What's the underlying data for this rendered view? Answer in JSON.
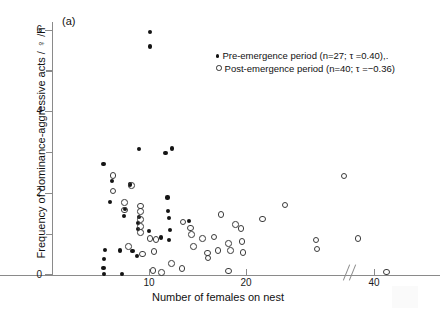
{
  "figure": {
    "panel_label": "(a)",
    "background_color": "#ffffff",
    "axis_color": "#8a8a8a",
    "point_color": "#141414"
  },
  "chart_data": {
    "type": "scatter",
    "title": "",
    "panel": "(a)",
    "xlabel": "Number of females on nest",
    "ylabel": "Frequency of dominance-aggressive acts / ♀ /h",
    "xlim": [
      0,
      48
    ],
    "ylim": [
      0,
      6.2
    ],
    "grid": false,
    "legend_position": "top-right",
    "axis_break": {
      "present": true,
      "symbol": "//",
      "between": [
        30,
        38
      ]
    },
    "xticks": [
      {
        "value": 10,
        "label": "10"
      },
      {
        "value": 20,
        "label": "20"
      },
      {
        "value": 40,
        "label": "40"
      }
    ],
    "yticks": [
      {
        "value": 0,
        "label": "0",
        "minor": false
      },
      {
        "value": 1,
        "label": "",
        "minor": true
      },
      {
        "value": 2,
        "label": "2",
        "minor": false
      },
      {
        "value": 3,
        "label": "",
        "minor": true
      },
      {
        "value": 4,
        "label": "4",
        "minor": false
      },
      {
        "value": 5,
        "label": "",
        "minor": true
      },
      {
        "value": 6,
        "label": "6",
        "minor": false
      }
    ],
    "series": [
      {
        "name": "Pre-emergence period (n=27; τ =0.40),.",
        "short_name": "Pre-emergence period",
        "marker": "filled-circle",
        "n": 27,
        "tau": 0.4,
        "points": [
          [
            10.1,
            5.95
          ],
          [
            10.1,
            5.6
          ],
          [
            9.0,
            3.08
          ],
          [
            11.7,
            2.98
          ],
          [
            12.4,
            3.1
          ],
          [
            5.3,
            2.72
          ],
          [
            6.2,
            2.3
          ],
          [
            8.0,
            2.22
          ],
          [
            6.0,
            1.78
          ],
          [
            11.9,
            1.9
          ],
          [
            7.5,
            1.62
          ],
          [
            12.0,
            1.56
          ],
          [
            7.4,
            1.44
          ],
          [
            9.0,
            1.42
          ],
          [
            12.1,
            1.4
          ],
          [
            8.9,
            1.28
          ],
          [
            14.1,
            1.32
          ],
          [
            8.9,
            1.12
          ],
          [
            10.0,
            1.08
          ],
          [
            12.2,
            1.1
          ],
          [
            11.2,
            0.92
          ],
          [
            12.1,
            0.86
          ],
          [
            5.5,
            0.62
          ],
          [
            7.0,
            0.6
          ],
          [
            8.3,
            0.58
          ],
          [
            8.8,
            0.46
          ],
          [
            5.4,
            0.4
          ],
          [
            5.3,
            0.18
          ],
          [
            5.4,
            0.02
          ],
          [
            7.2,
            0.02
          ]
        ]
      },
      {
        "name": "Post-emergence period (n=40; τ =−0.36)",
        "short_name": "Post-emergence period",
        "marker": "open-circle",
        "n": 40,
        "tau": -0.36,
        "points": [
          [
            6.2,
            2.46
          ],
          [
            6.2,
            2.08
          ],
          [
            8.1,
            2.22
          ],
          [
            7.4,
            1.8
          ],
          [
            7.4,
            1.62
          ],
          [
            9.0,
            1.72
          ],
          [
            9.0,
            1.58
          ],
          [
            9.0,
            1.38
          ],
          [
            9.0,
            1.22
          ],
          [
            9.0,
            1.06
          ],
          [
            13.4,
            1.32
          ],
          [
            14.2,
            1.18
          ],
          [
            14.3,
            1.02
          ],
          [
            10.0,
            0.92
          ],
          [
            10.6,
            0.9
          ],
          [
            15.4,
            0.92
          ],
          [
            19.4,
            1.16
          ],
          [
            21.6,
            1.4
          ],
          [
            23.9,
            1.74
          ],
          [
            17.3,
            1.5
          ],
          [
            18.8,
            1.26
          ],
          [
            7.8,
            0.72
          ],
          [
            9.2,
            0.54
          ],
          [
            10.4,
            0.6
          ],
          [
            16.6,
            0.96
          ],
          [
            18.1,
            0.8
          ],
          [
            19.5,
            0.84
          ],
          [
            17.0,
            0.62
          ],
          [
            18.3,
            0.62
          ],
          [
            19.6,
            0.58
          ],
          [
            14.5,
            0.72
          ],
          [
            15.9,
            0.56
          ],
          [
            16.0,
            0.44
          ],
          [
            12.2,
            0.3
          ],
          [
            13.3,
            0.18
          ],
          [
            10.3,
            0.14
          ],
          [
            11.2,
            0.08
          ],
          [
            18.1,
            0.12
          ],
          [
            27.1,
            0.88
          ],
          [
            27.2,
            0.66
          ],
          [
            33.4,
            0.92
          ],
          [
            30.0,
            2.45
          ],
          [
            44.5,
            0.1
          ]
        ]
      }
    ]
  },
  "legend": {
    "entries": [
      {
        "marker": "filled-circle",
        "text": "Pre-emergence period (n=27; τ =0.40),."
      },
      {
        "marker": "open-circle",
        "text": "Post-emergence period (n=40; τ =−0.36)"
      }
    ]
  }
}
